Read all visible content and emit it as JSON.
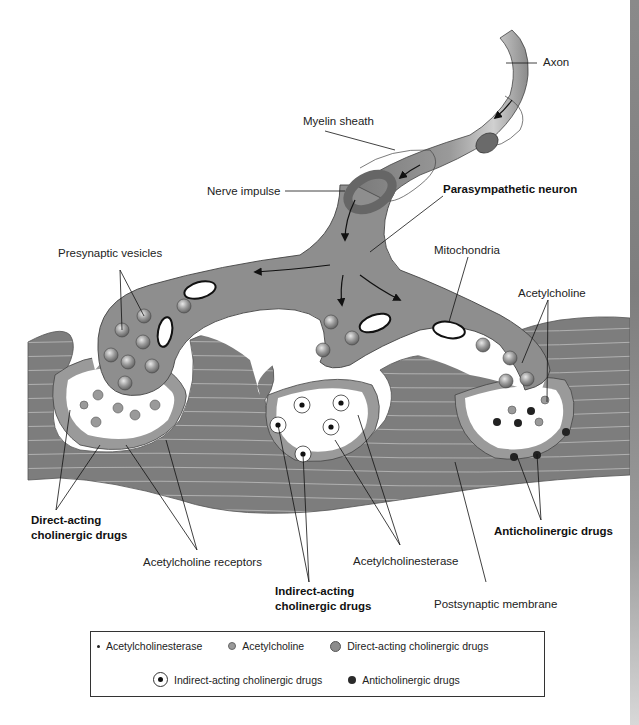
{
  "figure": {
    "labels": {
      "axon": "Axon",
      "myelin_sheath": "Myelin sheath",
      "nerve_impulse": "Nerve impulse",
      "parasympathetic_neuron": "Parasympathetic neuron",
      "presynaptic_vesicles": "Presynaptic vesicles",
      "mitochondria": "Mitochondria",
      "acetylcholine": "Acetylcholine",
      "direct_acting_line1": "Direct-acting",
      "direct_acting_line2": "cholinergic drugs",
      "acetylcholine_receptors": "Acetylcholine receptors",
      "indirect_acting_line1": "Indirect-acting",
      "indirect_acting_line2": "cholinergic drugs",
      "acetylcholinesterase": "Acetylcholinesterase",
      "postsynaptic_membrane": "Postsynaptic membrane",
      "anticholinergic_drugs": "Anticholinergic drugs"
    },
    "colors": {
      "neuron": "#8e8e8e",
      "neuron_highlight": "#c8c8c8",
      "node_ring": "#6a6a6a",
      "muscle": "#7d7d7d",
      "muscle_stripe": "#b8b8b8",
      "membrane": "#9a9a9a",
      "cleft": "#ffffff"
    }
  },
  "legend": {
    "items": [
      {
        "symbol": "small-dot",
        "label": "Acetylcholinesterase"
      },
      {
        "symbol": "gray-circle-small",
        "label": "Acetylcholine"
      },
      {
        "symbol": "gray-circle-large",
        "label": "Direct-acting cholinergic drugs"
      },
      {
        "symbol": "ringed-dot",
        "label": "Indirect-acting cholinergic drugs"
      },
      {
        "symbol": "black-dot",
        "label": "Anticholinergic drugs"
      }
    ]
  }
}
